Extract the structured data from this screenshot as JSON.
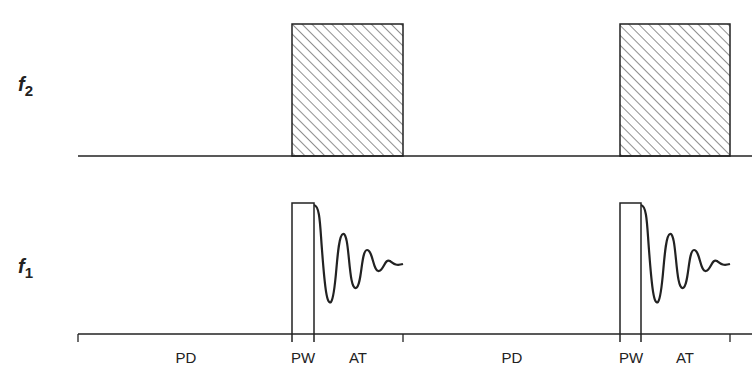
{
  "diagram": {
    "type": "pulse-sequence",
    "channels": [
      {
        "name": "f",
        "sub": "2"
      },
      {
        "name": "f",
        "sub": "1"
      }
    ],
    "time_labels": [
      "PD",
      "PW",
      "AT",
      "PD",
      "PW",
      "AT"
    ],
    "colors": {
      "ink": "#222222",
      "background": "#ffffff"
    }
  }
}
